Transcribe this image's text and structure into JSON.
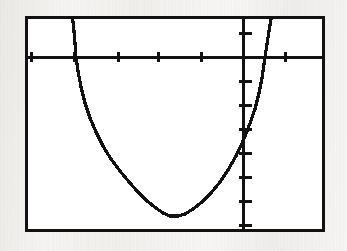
{
  "screen": {
    "device_label": "graphing-calculator-screen",
    "frame_color": "#111111",
    "screen_background": "#ffffff",
    "page_background": "#f4f3f1",
    "curve_color": "#121212"
  },
  "chart_data": {
    "type": "line",
    "title": "",
    "subtitle": "",
    "xlabel": "",
    "ylabel": "",
    "grid": false,
    "legend": "none",
    "axes": {
      "x_axis_visible": true,
      "y_axis_visible": true,
      "x_axis_pixel_y": 38,
      "y_axis_pixel_x": 215,
      "xlim": [
        -5.0,
        2.0
      ],
      "ylim": [
        -8.0,
        1.5
      ],
      "x_tick_step": 1,
      "y_tick_step": 1,
      "x_tick_pixels": [
        3,
        46,
        90,
        130,
        173,
        215,
        257,
        297
      ],
      "y_tick_pixels": [
        14,
        38,
        62,
        86,
        110,
        134,
        158,
        182,
        206
      ]
    },
    "series": [
      {
        "name": "parabola",
        "shape": "parabola-opening-up",
        "vertex_pixel": [
          142,
          197
        ],
        "x_intercept_pixels": [
          48,
          237
        ],
        "points_pixel": [
          [
            44,
            -4
          ],
          [
            45,
            3
          ],
          [
            46,
            12
          ],
          [
            47,
            24
          ],
          [
            48,
            38
          ],
          [
            50,
            52
          ],
          [
            53,
            68
          ],
          [
            57,
            84
          ],
          [
            62,
            99
          ],
          [
            68,
            113
          ],
          [
            75,
            127
          ],
          [
            83,
            140
          ],
          [
            92,
            152
          ],
          [
            101,
            163
          ],
          [
            110,
            173
          ],
          [
            119,
            182
          ],
          [
            128,
            189
          ],
          [
            135,
            194
          ],
          [
            142,
            197
          ],
          [
            150,
            197
          ],
          [
            157,
            195
          ],
          [
            165,
            190
          ],
          [
            174,
            183
          ],
          [
            183,
            174
          ],
          [
            192,
            163
          ],
          [
            200,
            151
          ],
          [
            208,
            137
          ],
          [
            215,
            122
          ],
          [
            221,
            107
          ],
          [
            227,
            90
          ],
          [
            231,
            74
          ],
          [
            234,
            59
          ],
          [
            236,
            45
          ],
          [
            237,
            38
          ],
          [
            239,
            25
          ],
          [
            241,
            12
          ],
          [
            243,
            0
          ],
          [
            245,
            -8
          ]
        ]
      }
    ]
  }
}
